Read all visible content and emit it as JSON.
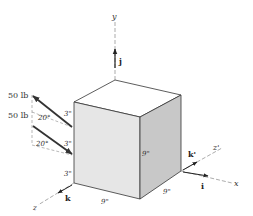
{
  "figure": {
    "colors": {
      "front_face": "#e6e6e6",
      "side_face": "#c8c8c8",
      "top_face": "#ffffff",
      "edge": "#333333",
      "axis": "#777777"
    },
    "axes": {
      "y": "y",
      "x": "x",
      "z": "z",
      "z_prime": "z'"
    },
    "unit_vectors": {
      "j": "j",
      "i": "i",
      "k": "k",
      "k_prime": "k'"
    },
    "forces": [
      {
        "label": "50 lb",
        "angle": "20°"
      },
      {
        "label": "50 lb",
        "angle": "20°"
      }
    ],
    "dimensions": {
      "spacing_top": "3\"",
      "spacing_middle": "3\"",
      "spacing_bottom": "3\"",
      "front_width": "9\"",
      "height": "9\"",
      "depth": "9\""
    }
  }
}
